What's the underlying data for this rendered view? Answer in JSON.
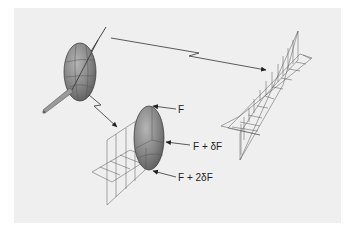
{
  "figure": {
    "background_color": "#efefef",
    "page_color": "#ffffff",
    "ellipse_fill": "#8a8a8a",
    "line_color": "#333333"
  },
  "labels": {
    "f": "F",
    "f_plus_df": "F + δF",
    "f_plus_2df": "F + 2δF"
  }
}
